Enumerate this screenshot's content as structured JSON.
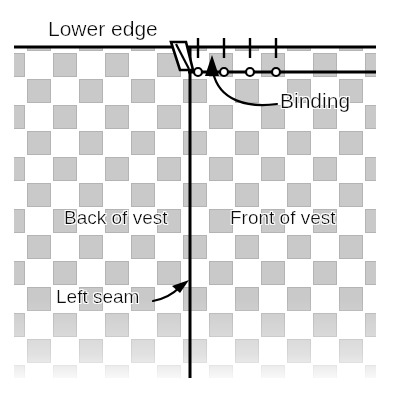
{
  "diagram": {
    "labels": {
      "lower_edge": "Lower edge",
      "binding": "Binding",
      "back_of_vest": "Back of vest",
      "front_of_vest": "Front of vest",
      "left_seam": "Left seam"
    },
    "colors": {
      "fabric_fill": "#c9c9c9",
      "fabric_stroke": "#b4b4b4",
      "line": "#000000",
      "background": "#ffffff",
      "text": "#111111"
    },
    "geometry": {
      "canvas_width": 394,
      "canvas_height": 393,
      "weave_cell_pitch": 26,
      "weave_block_size": 23,
      "weave_left": 14,
      "weave_right": 376,
      "weave_top": 48,
      "weave_bottom": 378,
      "lower_edge_line_y": 47,
      "binding_line_y": 72,
      "seam_line_x": 190,
      "binding_fold_x": 172
    },
    "stitch_ticks": {
      "count": 4,
      "x_positions": [
        198,
        224,
        250,
        276
      ],
      "top_y": 38,
      "bottom_y": 58,
      "description": "stitch tick marks above binding edge"
    },
    "stitch_circles": {
      "count": 4,
      "x_positions": [
        198,
        224,
        250,
        276
      ],
      "y": 72,
      "radius": 4,
      "description": "open circles marking binding stitches"
    },
    "pointers": [
      {
        "name": "binding-pointer",
        "from_label": "Binding",
        "arrow_tip": [
          212,
          57
        ],
        "direction": "up"
      },
      {
        "name": "left-seam-pointer",
        "from_label": "Left seam",
        "arrow_tip": [
          188,
          281
        ],
        "direction": "up-right"
      }
    ]
  }
}
